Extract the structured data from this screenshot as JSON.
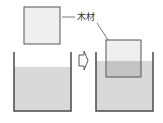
{
  "diagram": {
    "label_wood": "木材",
    "colors": {
      "water": "#d9d9d9",
      "water_in_block": "#c4c4c4",
      "block_fill": "#efefef",
      "outline": "#555555",
      "container_wall": "#4a4a4a"
    },
    "states": [
      {
        "name": "before",
        "description": "Wooden block above a container of water"
      },
      {
        "name": "after",
        "description": "Wooden block floating partially submerged; water level rises"
      }
    ],
    "arrow": "right-arrow"
  }
}
